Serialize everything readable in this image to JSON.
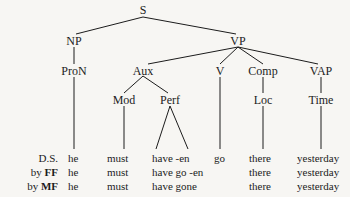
{
  "tree": {
    "nodes": {
      "S": "S",
      "NP": "NP",
      "VP": "VP",
      "ProN": "ProN",
      "Aux": "Aux",
      "V": "V",
      "Comp": "Comp",
      "VAP": "VAP",
      "Mod": "Mod",
      "Perf": "Perf",
      "Loc": "Loc",
      "Time": "Time"
    }
  },
  "rows": [
    {
      "label_prefix": "",
      "label_bold": "",
      "label_plain": "D.S.",
      "cells": [
        "he",
        "must",
        "have -en",
        "go",
        "there",
        "yesterday"
      ]
    },
    {
      "label_prefix": "by ",
      "label_bold": "FF",
      "label_plain": "",
      "cells": [
        "he",
        "must",
        "have go -en",
        "",
        "there",
        "yesterday"
      ]
    },
    {
      "label_prefix": "by ",
      "label_bold": "MF",
      "label_plain": "",
      "cells": [
        "he",
        "must",
        "have gone",
        "",
        "there",
        "yesterday"
      ]
    }
  ]
}
